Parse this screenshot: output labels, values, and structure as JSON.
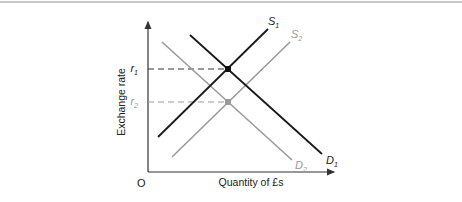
{
  "diagram": {
    "type": "supply-demand",
    "axes": {
      "y_label": "Exchange rate",
      "x_label": "Quantity of £s",
      "origin_label": "O"
    },
    "curves": [
      {
        "id": "D1",
        "label": "D",
        "sub": "1",
        "kind": "demand",
        "color": "#1a1a1a"
      },
      {
        "id": "D2",
        "label": "D",
        "sub": "2",
        "kind": "demand",
        "color": "#9a9a9a"
      },
      {
        "id": "S1",
        "label": "S",
        "sub": "1",
        "kind": "supply",
        "color": "#1a1a1a"
      },
      {
        "id": "S2",
        "label": "S",
        "sub": "2",
        "kind": "supply",
        "color": "#9a9a9a"
      }
    ],
    "equilibria": [
      {
        "id": "r1",
        "label": "r",
        "sub": "1",
        "color": "#111111"
      },
      {
        "id": "r2",
        "label": "r",
        "sub": "2",
        "color": "#9a9a9a"
      }
    ]
  }
}
